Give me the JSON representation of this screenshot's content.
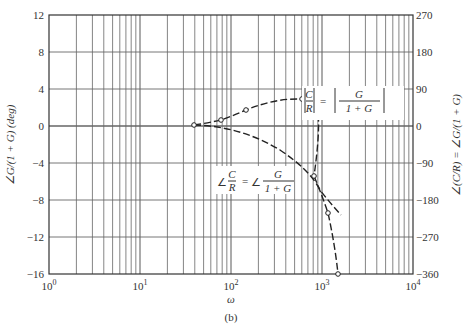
{
  "chart_data": {
    "type": "line",
    "title": "",
    "caption": "(b)",
    "xlabel": "ω",
    "xscale": "log",
    "xlim": [
      1,
      10000
    ],
    "xticks": [
      "10^0",
      "10^1",
      "10^2",
      "10^3",
      "10^4"
    ],
    "ylabel_left": "∠G/(1 + G) (deg)",
    "ylim_left": [
      -16,
      12
    ],
    "yticks_left": [
      12,
      8,
      4,
      0,
      -4,
      -8,
      -12,
      -16
    ],
    "ylabel_right": "∠(C/R) = ∠G/(1 + G)",
    "ylim_right": [
      -360,
      270
    ],
    "yticks_right": [
      270,
      180,
      90,
      0,
      -90,
      -180,
      -270,
      -360
    ],
    "grid": true,
    "series": [
      {
        "name": "|C/R| = |G/(1 + G)|",
        "axis": "left",
        "style": "dashed with circle markers",
        "x": [
          40,
          78,
          145,
          600,
          850,
          820,
          1150,
          1500
        ],
        "y": [
          0,
          0.6,
          1.7,
          2.9,
          2.7,
          -5.4,
          -9.4,
          -16
        ]
      },
      {
        "name": "∠C/R = ∠G/(1 + G)",
        "axis": "right",
        "style": "dashed",
        "x": [
          40,
          100,
          200,
          400,
          800,
          1500
        ],
        "y": [
          0,
          -4,
          -20,
          -70,
          -140,
          -200
        ]
      }
    ],
    "annotations": [
      "|C/R| = |G/(1 + G)|",
      "∠C/R = ∠G/(1 + G)"
    ]
  },
  "labels": {
    "left_ticks": [
      "12",
      "8",
      "4",
      "0",
      "−4",
      "−8",
      "−12",
      "−16"
    ],
    "right_ticks": [
      "270",
      "180",
      "90",
      "0",
      "−90",
      "−180",
      "−270",
      "−360"
    ],
    "x_ticks": [
      "10",
      "10",
      "10",
      "10",
      "10"
    ],
    "x_exps": [
      "0",
      "1",
      "2",
      "3",
      "4"
    ],
    "xlabel": "ω",
    "caption": "(b)",
    "ylabel_left": "∠G/(1 + G) (deg)",
    "ylabel_right": "∠(C/R) = ∠G/(1 + G)",
    "mag_lhs_num": "C",
    "mag_lhs_den": "R",
    "mag_eq": "=",
    "mag_rhs_num": "G",
    "mag_rhs_den": "1 + G",
    "ph_angle": "∠",
    "ph_lhs_num": "C",
    "ph_lhs_den": "R",
    "ph_eq": "=",
    "ph_rhs_num": "G",
    "ph_rhs_den": "1 + G"
  }
}
